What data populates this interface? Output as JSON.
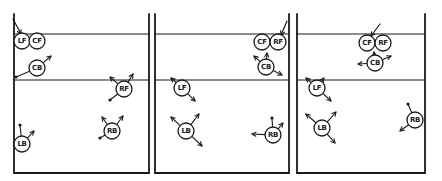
{
  "figure": {
    "type": "soccer-positional-cover-diagram",
    "background": "#ffffff",
    "ink_color": "#1a1a1a",
    "player_radius": 8,
    "label_font_size": 7,
    "field": {
      "top_y": 14,
      "goal_line_y": 34,
      "halfway_line_y": 80,
      "bottom_y": 173
    },
    "panels": [
      {
        "label": "panel-1",
        "left": 14,
        "right": 149,
        "ball_arrow": {
          "x1": 13,
          "y1": 19,
          "x2": 21,
          "y2": 34
        },
        "players": [
          {
            "label": "LF",
            "x": 22,
            "y": 41,
            "marks": []
          },
          {
            "label": "CF",
            "x": 37,
            "y": 41,
            "marks": []
          },
          {
            "label": "CB",
            "x": 37,
            "y": 68,
            "marks": [
              {
                "tx": 51,
                "ty": 56,
                "tip": "arrow"
              },
              {
                "tx": 16,
                "ty": 77,
                "tip": "dot"
              }
            ]
          },
          {
            "label": "RF",
            "x": 124,
            "y": 89,
            "marks": [
              {
                "tx": 110,
                "ty": 77,
                "tip": "arrow"
              },
              {
                "tx": 133,
                "ty": 74,
                "tip": "arrow"
              },
              {
                "tx": 110,
                "ty": 100,
                "tip": "dot"
              }
            ]
          },
          {
            "label": "RB",
            "x": 112,
            "y": 131,
            "marks": [
              {
                "tx": 102,
                "ty": 117,
                "tip": "arrow"
              },
              {
                "tx": 123,
                "ty": 116,
                "tip": "arrow"
              },
              {
                "tx": 100,
                "ty": 138,
                "tip": "dot"
              }
            ]
          },
          {
            "label": "LB",
            "x": 22,
            "y": 144,
            "marks": [
              {
                "tx": 20,
                "ty": 125,
                "tip": "dot"
              },
              {
                "tx": 34,
                "ty": 131,
                "tip": "arrow"
              }
            ]
          }
        ]
      },
      {
        "label": "panel-2",
        "left": 155,
        "right": 289,
        "ball_arrow": {
          "x1": 287,
          "y1": 21,
          "x2": 281,
          "y2": 35
        },
        "players": [
          {
            "label": "CF",
            "x": 262,
            "y": 42,
            "marks": []
          },
          {
            "label": "RF",
            "x": 278,
            "y": 42,
            "marks": []
          },
          {
            "label": "CB",
            "x": 266,
            "y": 67,
            "marks": [
              {
                "tx": 254,
                "ty": 56,
                "tip": "arrow"
              },
              {
                "tx": 267,
                "ty": 53,
                "tip": "arrow"
              },
              {
                "tx": 282,
                "ty": 75,
                "tip": "arrow"
              }
            ]
          },
          {
            "label": "LF",
            "x": 182,
            "y": 88,
            "marks": [
              {
                "tx": 171,
                "ty": 78,
                "tip": "arrow"
              },
              {
                "tx": 195,
                "ty": 101,
                "tip": "arrow"
              }
            ]
          },
          {
            "label": "LB",
            "x": 186,
            "y": 131,
            "marks": [
              {
                "tx": 171,
                "ty": 117,
                "tip": "arrow"
              },
              {
                "tx": 199,
                "ty": 114,
                "tip": "arrow"
              },
              {
                "tx": 202,
                "ty": 146,
                "tip": "arrow"
              }
            ]
          },
          {
            "label": "RB",
            "x": 273,
            "y": 135,
            "marks": [
              {
                "tx": 272,
                "ty": 118,
                "tip": "dot"
              },
              {
                "tx": 283,
                "ty": 123,
                "tip": "arrow"
              },
              {
                "tx": 252,
                "ty": 134,
                "tip": "arrow"
              }
            ]
          }
        ]
      },
      {
        "label": "panel-3",
        "left": 297,
        "right": 425,
        "ball_arrow": {
          "x1": 380,
          "y1": 24,
          "x2": 371,
          "y2": 36
        },
        "players": [
          {
            "label": "CF",
            "x": 367,
            "y": 43,
            "marks": []
          },
          {
            "label": "RF",
            "x": 383,
            "y": 43,
            "marks": []
          },
          {
            "label": "CB",
            "x": 375,
            "y": 63,
            "marks": [
              {
                "tx": 374,
                "ty": 52,
                "tip": "arrow"
              },
              {
                "tx": 358,
                "ty": 64,
                "tip": "arrow"
              },
              {
                "tx": 391,
                "ty": 56,
                "tip": "arrow"
              }
            ]
          },
          {
            "label": "LF",
            "x": 317,
            "y": 88,
            "marks": [
              {
                "tx": 306,
                "ty": 78,
                "tip": "arrow"
              },
              {
                "tx": 324,
                "ty": 78,
                "tip": "arrow"
              },
              {
                "tx": 331,
                "ty": 101,
                "tip": "arrow"
              }
            ]
          },
          {
            "label": "LB",
            "x": 322,
            "y": 128,
            "marks": [
              {
                "tx": 306,
                "ty": 114,
                "tip": "arrow"
              },
              {
                "tx": 336,
                "ty": 112,
                "tip": "arrow"
              },
              {
                "tx": 335,
                "ty": 143,
                "tip": "arrow"
              }
            ]
          },
          {
            "label": "RB",
            "x": 415,
            "y": 120,
            "marks": [
              {
                "tx": 408,
                "ty": 104,
                "tip": "dot"
              },
              {
                "tx": 400,
                "ty": 131,
                "tip": "arrow"
              }
            ]
          }
        ]
      }
    ]
  }
}
